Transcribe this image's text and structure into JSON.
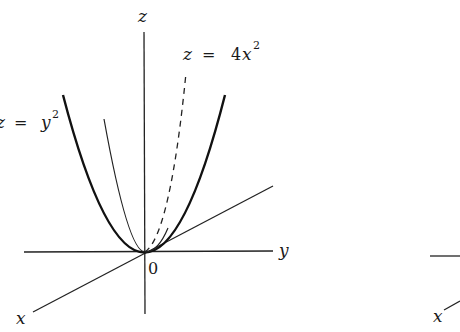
{
  "figure_left": {
    "axes": {
      "z_label": "z",
      "y_label": "y",
      "x_label": "x",
      "origin_label": "0"
    },
    "curves": [
      {
        "name": "z = y^2",
        "label_lhs": "z",
        "label_eq": "=",
        "label_var": "y",
        "label_exp": "2",
        "style": "thick solid"
      },
      {
        "name": "z = 4x^2",
        "label_lhs": "z",
        "label_eq": "=",
        "label_coef": "4",
        "label_var": "x",
        "label_exp": "2",
        "style": "dashed"
      },
      {
        "name": "intermediate parabola",
        "style": "thin solid"
      }
    ]
  },
  "figure_right_partial": {
    "axes": {
      "x_label": "x"
    }
  }
}
